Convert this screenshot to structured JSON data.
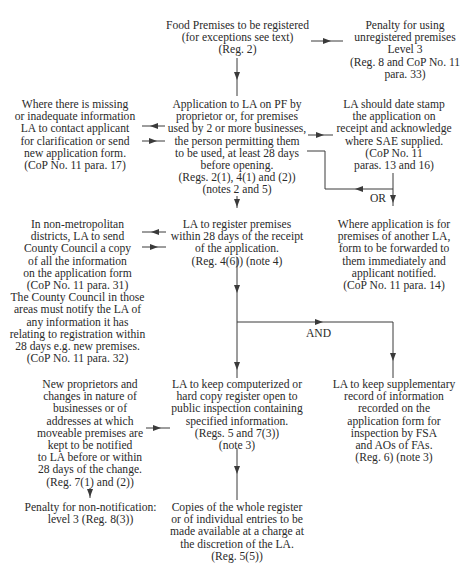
{
  "diagram": {
    "type": "flowchart",
    "line_color": "#3a3a3a",
    "text_color": "#2a2a2a",
    "nodes": {
      "food_premises": {
        "lines": [
          "Food Premises to be registered",
          "(for exceptions see text)",
          "(Reg. 2)"
        ]
      },
      "penalty_unregistered": {
        "lines": [
          "Penalty for using",
          "unregistered premises",
          "Level 3",
          "(Reg. 8 and CoP No. 11",
          "para. 33)"
        ]
      },
      "missing_info": {
        "lines": [
          "Where there is missing",
          "or inadequate information",
          "LA to contact applicant",
          "for clarification or send",
          "new application form.",
          "(CoP No. 11 para. 17)"
        ]
      },
      "application": {
        "lines": [
          "Application to LA on PF by",
          "proprietor or, for premises",
          "used by 2 or more businesses,",
          "the person permitting them",
          "to be used, at least 28 days",
          "before opening.",
          "(Regs. 2(1), 4(1) and (2))",
          "(notes 2 and 5)"
        ]
      },
      "date_stamp": {
        "lines": [
          "LA should date stamp",
          "the application on",
          "receipt and acknowledge",
          "where SAE supplied.",
          "(CoP No. 11",
          "paras. 13 and 16)"
        ]
      },
      "county_council": {
        "lines": [
          "In non-metropolitan",
          "districts, LA to send",
          "County Council a copy",
          "of all the information",
          "on the application form",
          "(CoP No. 11 para. 31)",
          "The County Council in those",
          "areas must notify the LA of",
          "any information it has",
          "relating to registration within",
          "28 days e.g. new premises.",
          "(CoP No. 11 para. 32)"
        ]
      },
      "register_premises": {
        "lines": [
          "LA to register premises",
          "within 28 days of the receipt",
          "of the application.",
          "(Reg. 4(6)) (note 4)"
        ]
      },
      "another_la": {
        "lines": [
          "Where application is for",
          "premises of another LA,",
          "form to be forwarded to",
          "them immediately and",
          "applicant notified.",
          "(CoP No. 11 para. 14)"
        ]
      },
      "new_proprietors": {
        "lines": [
          "New proprietors and",
          "changes in nature of",
          "businesses or of",
          "addresses at which",
          "moveable premises are",
          "kept to be notified",
          "to LA before or within",
          "28 days of the change.",
          "(Reg. 7(1) and (2))"
        ]
      },
      "keep_register": {
        "lines": [
          "LA to keep computerized or",
          "hard copy register open to",
          "public inspection containing",
          "specified information.",
          "(Regs. 5 and 7(3))",
          "(note 3)"
        ]
      },
      "supplementary_record": {
        "lines": [
          "LA to keep supplementary",
          "record of information",
          "recorded on the",
          "application form for",
          "inspection by FSA",
          "and AOs of FAs.",
          "(Reg. 6) (note 3)"
        ]
      },
      "penalty_notification": {
        "lines": [
          "Penalty for non-notification:",
          "level 3 (Reg. 8(3))"
        ]
      },
      "copies_register": {
        "lines": [
          "Copies of the whole register",
          "or of individual entries to be",
          "made available at a charge at",
          "the discretion of the LA.",
          "(Reg. 5(5))"
        ]
      }
    },
    "edge_labels": {
      "or": "OR",
      "and": "AND"
    },
    "edges": [
      {
        "from": "food_premises",
        "to": "penalty_unregistered"
      },
      {
        "from": "food_premises",
        "to": "application"
      },
      {
        "from": "application",
        "to": "missing_info"
      },
      {
        "from": "missing_info",
        "to": "application"
      },
      {
        "from": "application",
        "to": "date_stamp"
      },
      {
        "from": "date_stamp",
        "to": "application",
        "label": "OR"
      },
      {
        "from": "date_stamp",
        "to": "another_la",
        "label": "OR"
      },
      {
        "from": "application",
        "to": "register_premises"
      },
      {
        "from": "register_premises",
        "to": "county_council"
      },
      {
        "from": "county_council",
        "to": "register_premises"
      },
      {
        "from": "register_premises",
        "to": "keep_register",
        "label": "AND"
      },
      {
        "from": "register_premises",
        "to": "supplementary_record",
        "label": "AND"
      },
      {
        "from": "new_proprietors",
        "to": "keep_register"
      },
      {
        "from": "new_proprietors",
        "to": "penalty_notification"
      },
      {
        "from": "keep_register",
        "to": "copies_register"
      }
    ]
  }
}
